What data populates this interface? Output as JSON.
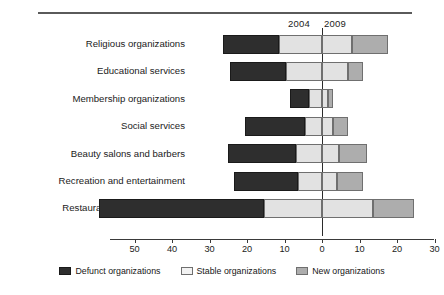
{
  "figure": {
    "top_rule": true,
    "period_labels": {
      "left": "2004",
      "right": "2009"
    }
  },
  "legend": {
    "items": [
      {
        "key": "defunct",
        "label": "Defunct organizations",
        "color": "#2e2e2e"
      },
      {
        "key": "stable",
        "label": "Stable organizations",
        "color": "#f2f2f2"
      },
      {
        "key": "new",
        "label": "New organizations",
        "color": "#adadad"
      }
    ]
  },
  "axis": {
    "tick_labels": [
      "50",
      "40",
      "30",
      "20",
      "10",
      "0",
      "10",
      "20",
      "30"
    ],
    "tick_values": [
      -50,
      -40,
      -30,
      -20,
      -10,
      0,
      10,
      20,
      30
    ]
  },
  "chart_data": {
    "type": "bar",
    "orientation": "horizontal",
    "stacked": true,
    "diverging": true,
    "title": "",
    "xlabel": "",
    "ylabel": "",
    "xlim": [
      -50,
      30
    ],
    "grid": false,
    "legend_position": "bottom-center",
    "annotations": [
      "2004",
      "2009"
    ],
    "categories": [
      "Religious organizations",
      "Educational services",
      "Membership organizations",
      "Social services",
      "Beauty salons and barbers",
      "Recreation and entertainment",
      "Restaurants, cafes, and bars"
    ],
    "series": [
      {
        "name": "Defunct organizations",
        "side": "left",
        "values": [
          15,
          15,
          5,
          16,
          18,
          17,
          44
        ]
      },
      {
        "name": "Stable organizations (2004 side)",
        "side": "left",
        "values": [
          11.5,
          9.5,
          3.5,
          4.5,
          7,
          6.5,
          15.5
        ]
      },
      {
        "name": "Stable organizations (2009 side)",
        "side": "right",
        "values": [
          8,
          7,
          1.5,
          3,
          4.5,
          4,
          13.5
        ]
      },
      {
        "name": "New organizations",
        "side": "right",
        "values": [
          9.5,
          4,
          1.5,
          4,
          7.5,
          7,
          11
        ]
      }
    ]
  }
}
